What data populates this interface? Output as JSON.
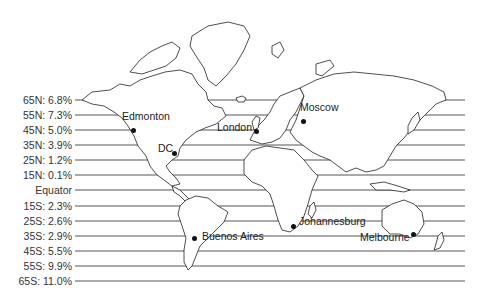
{
  "latitudes": [
    {
      "label": "65N: 6.8%",
      "y": 100
    },
    {
      "label": "55N: 7.3%",
      "y": 115
    },
    {
      "label": "45N: 5.0%",
      "y": 130
    },
    {
      "label": "35N: 3.9%",
      "y": 145
    },
    {
      "label": "25N: 1.2%",
      "y": 160
    },
    {
      "label": "15N: 0.1%",
      "y": 175
    },
    {
      "label": "Equator",
      "y": 190
    },
    {
      "label": "15S: 2.3%",
      "y": 206
    },
    {
      "label": "25S: 2.6%",
      "y": 221
    },
    {
      "label": "35S: 2.9%",
      "y": 236
    },
    {
      "label": "45S: 5.5%",
      "y": 251
    },
    {
      "label": "55S: 9.9%",
      "y": 266
    },
    {
      "label": "65S: 11.0%",
      "y": 281
    }
  ],
  "cities": [
    {
      "name": "Edmonton",
      "dot_x": 133,
      "dot_y": 130,
      "label_x": 122,
      "label_y": 116
    },
    {
      "name": "DC",
      "dot_x": 174,
      "dot_y": 153,
      "label_x": 158,
      "label_y": 148
    },
    {
      "name": "London",
      "dot_x": 256,
      "dot_y": 131,
      "label_x": 217,
      "label_y": 127
    },
    {
      "name": "Moscow",
      "dot_x": 303,
      "dot_y": 121,
      "label_x": 300,
      "label_y": 107
    },
    {
      "name": "Johannesburg",
      "dot_x": 293,
      "dot_y": 226,
      "label_x": 299,
      "label_y": 221
    },
    {
      "name": "Buenos Aires",
      "dot_x": 194,
      "dot_y": 238,
      "label_x": 202,
      "label_y": 236
    },
    {
      "name": "Melbourne",
      "dot_x": 413,
      "dot_y": 234,
      "label_x": 360,
      "label_y": 237
    }
  ],
  "colors": {
    "line": "#555555",
    "coast": "#222222",
    "background": "#ffffff"
  }
}
